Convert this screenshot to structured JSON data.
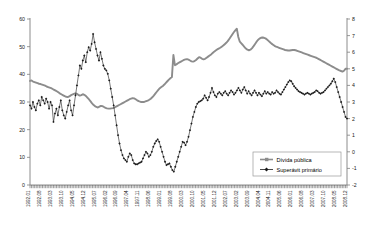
{
  "chart_data": {
    "type": "line",
    "title": "",
    "xlabel": "",
    "ylabel": "",
    "y2label": "",
    "grid": false,
    "legend_position": "bottom-right",
    "ylim": [
      0,
      60
    ],
    "y2lim": [
      -2,
      8
    ],
    "yticks": [
      0,
      10,
      20,
      30,
      40,
      50,
      60
    ],
    "y2ticks": [
      -2,
      -1,
      0,
      1,
      2,
      3,
      4,
      5,
      6,
      7,
      8
    ],
    "xtick_labels": [
      "1992.01",
      "1992.08",
      "1993.03",
      "1993.10",
      "1994.05",
      "1994.12",
      "1995.07",
      "1996.02",
      "1996.09",
      "1997.04",
      "1997.11",
      "1998.06",
      "1999.01",
      "1999.08",
      "2000.03",
      "2000.10",
      "2001.05",
      "2001.12",
      "2002.07",
      "2003.02",
      "2003.09",
      "2004.04",
      "2004.11",
      "2005.06",
      "2006.01",
      "2006.08",
      "2007.03",
      "2007.10",
      "2008.05",
      "2008.12"
    ],
    "x_start": "1992.01",
    "x_end": "2008.12",
    "x_count": 204,
    "series": [
      {
        "name": "Dívida pública",
        "axis": "left",
        "color": "#8c8c8c",
        "marker": "square",
        "values": [
          37.6,
          37.8,
          37.4,
          37.2,
          37.0,
          36.8,
          36.6,
          36.5,
          36.3,
          36.1,
          35.9,
          35.6,
          35.4,
          35.2,
          35.0,
          34.7,
          34.4,
          34.1,
          33.8,
          33.4,
          33.0,
          32.7,
          32.4,
          32.1,
          31.9,
          31.8,
          32.0,
          32.4,
          32.7,
          32.9,
          33.1,
          33.0,
          32.6,
          32.3,
          32.5,
          32.8,
          32.6,
          32.2,
          31.6,
          31.0,
          30.3,
          29.6,
          29.0,
          28.5,
          28.2,
          28.0,
          28.3,
          28.6,
          28.5,
          28.2,
          27.9,
          27.7,
          27.6,
          27.6,
          27.7,
          27.8,
          28.0,
          28.3,
          28.6,
          28.9,
          29.2,
          29.5,
          29.8,
          30.1,
          30.4,
          30.7,
          31.0,
          31.2,
          31.4,
          31.3,
          31.0,
          30.6,
          30.3,
          30.1,
          30.0,
          30.0,
          30.1,
          30.3,
          30.5,
          30.8,
          31.2,
          31.7,
          32.3,
          33.0,
          33.7,
          34.4,
          35.0,
          35.4,
          35.8,
          36.3,
          36.9,
          37.5,
          38.1,
          38.6,
          39.0,
          47.0,
          43.3,
          43.6,
          44.0,
          44.3,
          44.6,
          44.9,
          45.2,
          45.4,
          45.5,
          45.3,
          45.0,
          44.7,
          44.6,
          44.8,
          45.2,
          45.7,
          46.2,
          46.0,
          45.6,
          45.4,
          45.6,
          46.0,
          46.4,
          46.8,
          47.2,
          47.7,
          48.2,
          48.6,
          49.0,
          49.3,
          49.6,
          50.0,
          50.4,
          50.9,
          51.4,
          52.0,
          52.8,
          53.6,
          54.4,
          55.2,
          55.9,
          56.5,
          53.5,
          51.8,
          51.2,
          50.6,
          49.9,
          49.3,
          48.9,
          48.7,
          48.9,
          49.4,
          50.1,
          50.9,
          51.7,
          52.4,
          52.9,
          53.2,
          53.3,
          53.2,
          53.0,
          52.6,
          52.1,
          51.6,
          51.1,
          50.7,
          50.3,
          50.0,
          49.8,
          49.6,
          49.4,
          49.2,
          49.0,
          48.8,
          48.7,
          48.6,
          48.6,
          48.7,
          48.8,
          48.8,
          48.7,
          48.5,
          48.3,
          48.1,
          47.9,
          47.7,
          47.5,
          47.3,
          47.1,
          46.9,
          46.7,
          46.5,
          46.3,
          46.1,
          45.9,
          45.6,
          45.3,
          45.0,
          44.7,
          44.4,
          44.1,
          43.8,
          43.5,
          43.2,
          42.9,
          42.6,
          42.3,
          42.0,
          41.7,
          41.4,
          41.2,
          41.0,
          41.3,
          42.0,
          42.0
        ]
      },
      {
        "name": "Superávit primário",
        "axis": "right",
        "color": "#1a1a1a",
        "marker": "diamond",
        "values": [
          2.8,
          2.6,
          3.0,
          2.7,
          2.5,
          2.9,
          3.1,
          2.8,
          3.3,
          3.1,
          2.9,
          3.2,
          3.0,
          2.6,
          3.0,
          2.8,
          1.8,
          2.3,
          2.6,
          2.2,
          2.7,
          3.1,
          2.5,
          2.2,
          2.0,
          2.4,
          2.8,
          3.1,
          2.5,
          2.2,
          2.8,
          3.4,
          4.0,
          4.6,
          5.2,
          5.0,
          5.5,
          5.8,
          5.4,
          6.0,
          6.3,
          6.1,
          6.5,
          7.1,
          6.6,
          6.2,
          5.8,
          5.5,
          6.0,
          5.6,
          5.2,
          5.0,
          4.9,
          4.7,
          4.3,
          3.8,
          3.3,
          2.8,
          2.2,
          1.6,
          1.0,
          0.5,
          0.1,
          -0.2,
          -0.4,
          -0.5,
          -0.6,
          -0.3,
          -0.1,
          -0.2,
          -0.5,
          -0.7,
          -0.75,
          -0.75,
          -0.7,
          -0.65,
          -0.6,
          -0.4,
          -0.2,
          0.0,
          -0.1,
          -0.3,
          -0.2,
          0.0,
          0.3,
          0.5,
          0.65,
          0.75,
          0.6,
          0.3,
          0.0,
          -0.3,
          -0.6,
          -0.8,
          -0.75,
          -0.7,
          -0.9,
          -1.1,
          -1.2,
          -0.9,
          -0.6,
          -0.3,
          0.0,
          0.3,
          0.6,
          0.55,
          0.4,
          0.6,
          0.9,
          1.3,
          1.7,
          2.1,
          2.4,
          2.7,
          2.9,
          3.0,
          3.05,
          3.1,
          3.2,
          3.4,
          3.25,
          3.1,
          3.3,
          3.55,
          3.85,
          3.6,
          3.4,
          3.3,
          3.5,
          3.6,
          3.5,
          3.4,
          3.55,
          3.65,
          3.5,
          3.4,
          3.55,
          3.7,
          3.6,
          3.45,
          3.55,
          3.7,
          3.85,
          3.7,
          3.55,
          3.75,
          3.9,
          3.7,
          3.5,
          3.65,
          3.5,
          3.4,
          3.55,
          3.7,
          3.55,
          3.4,
          3.55,
          3.45,
          3.35,
          3.5,
          3.65,
          3.5,
          3.6,
          3.5,
          3.45,
          3.6,
          3.5,
          3.55,
          3.7,
          3.6,
          3.5,
          3.45,
          3.6,
          3.75,
          3.9,
          4.05,
          4.2,
          4.3,
          4.25,
          4.1,
          3.95,
          3.85,
          3.75,
          3.65,
          3.6,
          3.55,
          3.5,
          3.45,
          3.5,
          3.55,
          3.5,
          3.45,
          3.5,
          3.55,
          3.6,
          3.7,
          3.65,
          3.55,
          3.5,
          3.55,
          3.6,
          3.7,
          3.8,
          3.9,
          4.0,
          4.1,
          4.25,
          4.4,
          4.2,
          3.9,
          3.6,
          3.3,
          3.0,
          2.7,
          2.4,
          2.1,
          2.0
        ]
      }
    ]
  },
  "legend": {
    "items": [
      {
        "label": "Dívida pública",
        "marker": "square",
        "color": "#8c8c8c"
      },
      {
        "label": "Superávit primário",
        "marker": "diamond",
        "color": "#1a1a1a"
      }
    ]
  }
}
